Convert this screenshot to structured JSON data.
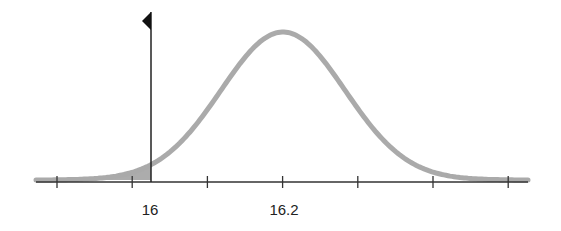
{
  "chart_data": {
    "type": "area",
    "title": "",
    "mean": 16.2,
    "marked_value": 16,
    "tick_labels": [
      "16",
      "16.2"
    ],
    "ticks_count": 7,
    "shaded_region": "left tail, x < 16",
    "xlabel": "",
    "ylabel": "",
    "grid": false,
    "legend": "none",
    "colors": {
      "curve": "#aaaaaa",
      "shade": "#9a9a9a",
      "axis": "#333333",
      "marker_line": "#222222",
      "flag": "#111111"
    }
  },
  "labels": {
    "tick_16": "16",
    "tick_16_2": "16.2"
  }
}
